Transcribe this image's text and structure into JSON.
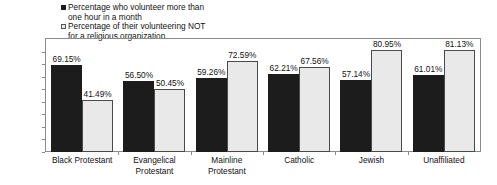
{
  "chart_data": {
    "type": "bar",
    "title": "",
    "xlabel": "",
    "ylabel": "",
    "ylim": [
      0,
      90
    ],
    "grid": false,
    "legend_position": "top-left",
    "categories": [
      "Black Protestant",
      "Evangelical\nProtestant",
      "Mainline\nProtestant",
      "Catholic",
      "Jewish",
      "Unaffiliated"
    ],
    "ytick_labels": [
      "90%",
      "80%",
      "70%",
      "60%",
      "50%",
      "40%",
      "30%",
      "20%",
      "10%",
      "0%"
    ],
    "ytick_values": [
      90,
      80,
      70,
      60,
      50,
      40,
      30,
      20,
      10,
      0
    ],
    "series": [
      {
        "name": "Percentage who volunteer more than one hour in a month",
        "color": "#1c1c1c",
        "values": [
          69.15,
          56.5,
          59.26,
          62.21,
          57.14,
          61.01
        ],
        "labels": [
          "69.15%",
          "56.50%",
          "59.26%",
          "62.21%",
          "57.14%",
          "61.01%"
        ]
      },
      {
        "name": "Percentage of their volunteering NOT for a religious organization",
        "color": "#e9e9e9",
        "values": [
          41.49,
          50.45,
          72.59,
          67.56,
          80.95,
          81.13
        ],
        "labels": [
          "41.49%",
          "50.45%",
          "72.59%",
          "67.56%",
          "80.95%",
          "81.13%"
        ]
      }
    ]
  },
  "legend": {
    "items": [
      {
        "marker": "dark-square-marker",
        "label": "Percentage who volunteer more than\none hour in a month"
      },
      {
        "marker": "light-square-marker",
        "label": "Percentage of their volunteering NOT\nfor a religious organization"
      }
    ]
  }
}
